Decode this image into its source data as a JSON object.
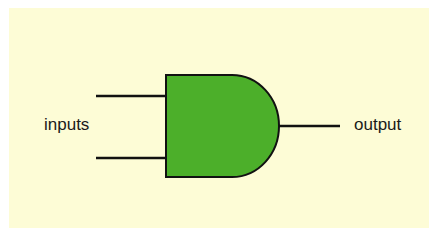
{
  "diagram": {
    "type": "AND gate",
    "colors": {
      "background": "#fdfcd6",
      "gate_fill": "#4caf2a",
      "stroke": "#111111"
    },
    "labels": {
      "inputs": "inputs",
      "output": "output"
    }
  }
}
